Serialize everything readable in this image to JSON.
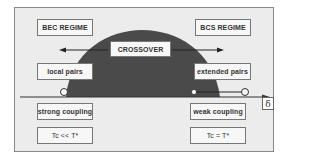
{
  "diagram": {
    "regimes": {
      "left": "BEC REGIME",
      "right": "BCS REGIME",
      "center": "CROSSOVER"
    },
    "pairs": {
      "left": "local pairs",
      "right": "extended pairs"
    },
    "coupling": {
      "left": "strong coupling",
      "right": "weak coupling"
    },
    "temperature": {
      "left": "Tc << T*",
      "right": "Tc = T*"
    },
    "axis": {
      "label": "δ"
    },
    "colors": {
      "dome": "#4a4a4a",
      "background": "#ececec",
      "frame": "#8a8a8a"
    }
  }
}
